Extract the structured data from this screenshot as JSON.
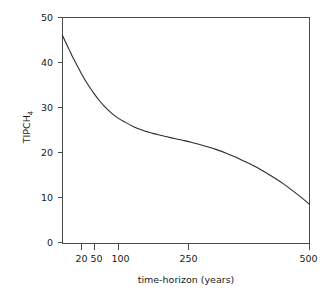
{
  "chart_data": {
    "type": "line",
    "title": "",
    "subtitle": "",
    "xlabel": "time-horizon (years)",
    "ylabel": "TIPCH",
    "ylabel_subscript": "4",
    "ylabel_full": "TIPCH4",
    "xscale": "log",
    "yscale": "linear",
    "xlim": [
      17,
      500
    ],
    "ylim": [
      0,
      50
    ],
    "xticks": [
      20,
      50,
      100,
      250,
      500
    ],
    "xtick_labels": [
      "20",
      "50",
      "100",
      "250",
      "500"
    ],
    "yticks": [
      0,
      10,
      20,
      30,
      40,
      50
    ],
    "ytick_labels": [
      "0",
      "10",
      "20",
      "30",
      "40",
      "50"
    ],
    "grid": false,
    "legend": false,
    "legend_position": "none",
    "frame": "full-box",
    "series": [
      {
        "name": "TIPCH4",
        "color": "#2b2b2b",
        "x": [
          17,
          18,
          19,
          20,
          22,
          24,
          26,
          28,
          30,
          33,
          36,
          40,
          45,
          50,
          55,
          60,
          65,
          70,
          80,
          90,
          100,
          110,
          125,
          140,
          160,
          180,
          200,
          225,
          250,
          280,
          310,
          350,
          400,
          450,
          500
        ],
        "y": [
          46.0,
          44.0,
          42.2,
          40.5,
          37.6,
          35.2,
          33.3,
          31.7,
          30.4,
          28.9,
          27.8,
          26.8,
          25.8,
          25.1,
          24.6,
          24.2,
          23.9,
          23.6,
          23.1,
          22.7,
          22.3,
          21.9,
          21.3,
          20.7,
          19.9,
          19.1,
          18.3,
          17.4,
          16.5,
          15.4,
          14.4,
          13.1,
          11.5,
          10.0,
          8.6
        ]
      }
    ]
  },
  "axes": {
    "ylabel_text": "TIPCH",
    "ylabel_sub": "4",
    "xlabel_text": "time-horizon (years)"
  }
}
